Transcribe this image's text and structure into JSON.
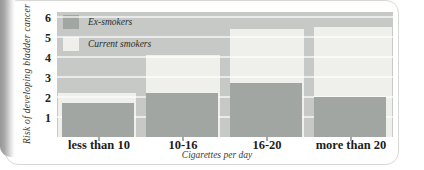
{
  "chart_data": {
    "type": "bar",
    "title": "",
    "categories": [
      "less than 10",
      "10-16",
      "16-20",
      "more than 20"
    ],
    "series": [
      {
        "name": "Ex-smokers",
        "color": "#a2a6a3",
        "values": [
          1.7,
          2.2,
          2.7,
          2.0
        ]
      },
      {
        "name": "Current smokers",
        "color": "#eff0eb",
        "values": [
          2.2,
          4.1,
          5.4,
          5.5
        ]
      }
    ],
    "xlabel": "Cigarettes per day",
    "ylabel": "Risk of  developing bladder cancer",
    "yticks": [
      1,
      2,
      3,
      4,
      5,
      6
    ],
    "ylim": [
      0,
      6.25
    ],
    "grid": "horizontal",
    "legend_position": "top-left-inside",
    "plot_bg": "#c6c9c5",
    "gridline_color": "rgba(255,255,255,0.62)"
  },
  "frame": {
    "card_border_color": "#d8d8d6",
    "page_background": "#ffffff"
  }
}
